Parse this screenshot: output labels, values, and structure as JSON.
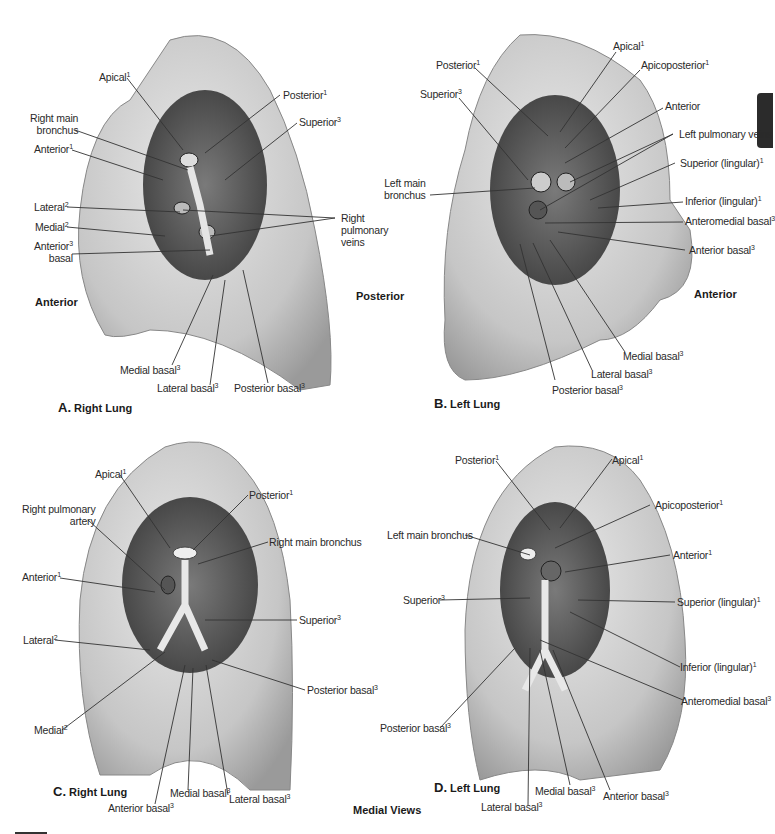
{
  "figure": {
    "center_caption": "Medial Views",
    "side_labels": {
      "a_anterior": "Anterior",
      "b_posterior": "Posterior",
      "b_anterior": "Anterior"
    }
  },
  "panels": [
    {
      "id": "A",
      "letter": "A.",
      "title": "Right Lung",
      "labels": [
        {
          "text": "Apical",
          "sup": "1"
        },
        {
          "text": "Right main",
          "text2": "bronchus",
          "sup": ""
        },
        {
          "text": "Anterior",
          "sup": "1"
        },
        {
          "text": "Lateral",
          "sup": "2"
        },
        {
          "text": "Medial",
          "sup": "2"
        },
        {
          "text": "Anterior",
          "text2": "basal",
          "sup": "3"
        },
        {
          "text": "Posterior",
          "sup": "1"
        },
        {
          "text": "Superior",
          "sup": "3"
        },
        {
          "text": "Right",
          "text2": "pulmonary",
          "text3": "veins",
          "sup": ""
        },
        {
          "text": "Medial basal",
          "sup": "3"
        },
        {
          "text": "Lateral basal",
          "sup": "3"
        },
        {
          "text": "Posterior basal",
          "sup": "3"
        }
      ]
    },
    {
      "id": "B",
      "letter": "B.",
      "title": "Left Lung",
      "labels": [
        {
          "text": "Apical",
          "sup": "1"
        },
        {
          "text": "Posterior",
          "sup": "1"
        },
        {
          "text": "Apicoposterior",
          "sup": "1"
        },
        {
          "text": "Superior",
          "sup": "3"
        },
        {
          "text": "Anterior",
          "sup": ""
        },
        {
          "text": "Left pulmonary veins",
          "sup": ""
        },
        {
          "text": "Left main",
          "text2": "bronchus",
          "sup": ""
        },
        {
          "text": "Superior (lingular)",
          "sup": "1"
        },
        {
          "text": "Inferior (lingular)",
          "sup": "1"
        },
        {
          "text": "Anteromedial basal",
          "sup": "3"
        },
        {
          "text": "Anterior basal",
          "sup": "3"
        },
        {
          "text": "Medial basal",
          "sup": "3"
        },
        {
          "text": "Lateral basal",
          "sup": "3"
        },
        {
          "text": "Posterior basal",
          "sup": "3"
        }
      ]
    },
    {
      "id": "C",
      "letter": "C.",
      "title": "Right Lung",
      "labels": [
        {
          "text": "Apical",
          "sup": "1"
        },
        {
          "text": "Right pulmonary",
          "text2": "artery",
          "sup": ""
        },
        {
          "text": "Posterior",
          "sup": "1"
        },
        {
          "text": "Right main bronchus",
          "sup": ""
        },
        {
          "text": "Anterior",
          "sup": "1"
        },
        {
          "text": "Superior",
          "sup": "3"
        },
        {
          "text": "Lateral",
          "sup": "2"
        },
        {
          "text": "Posterior basal",
          "sup": "3"
        },
        {
          "text": "Medial",
          "sup": "2"
        },
        {
          "text": "Anterior basal",
          "sup": "3"
        },
        {
          "text": "Medial basal",
          "sup": "3"
        },
        {
          "text": "Lateral basal",
          "sup": "3"
        }
      ]
    },
    {
      "id": "D",
      "letter": "D.",
      "title": "Left Lung",
      "labels": [
        {
          "text": "Posterior",
          "sup": "1"
        },
        {
          "text": "Apical",
          "sup": "1"
        },
        {
          "text": "Apicoposterior",
          "sup": "1"
        },
        {
          "text": "Left main bronchus",
          "sup": ""
        },
        {
          "text": "Anterior",
          "sup": "1"
        },
        {
          "text": "Superior",
          "sup": "3"
        },
        {
          "text": "Superior (lingular)",
          "sup": "1"
        },
        {
          "text": "Inferior (lingular)",
          "sup": "1"
        },
        {
          "text": "Anteromedial basal",
          "sup": "3"
        },
        {
          "text": "Posterior basal",
          "sup": "3"
        },
        {
          "text": "Lateral basal",
          "sup": "3"
        },
        {
          "text": "Medial basal",
          "sup": "3"
        },
        {
          "text": "Anterior basal",
          "sup": "3"
        }
      ]
    }
  ],
  "colors": {
    "lung_fill": "#d4d4d4",
    "lung_dark": "#8a8a8a",
    "hilum": "#5a5a5a",
    "line": "#333333",
    "tab": "#2b2b2b"
  }
}
